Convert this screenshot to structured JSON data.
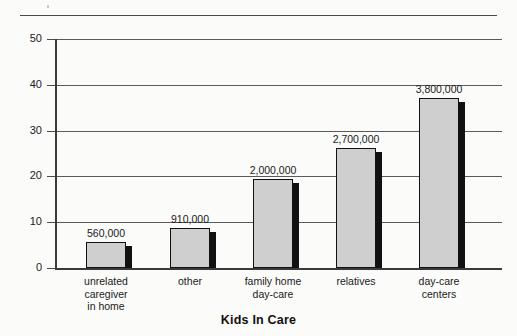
{
  "chart_data": {
    "type": "bar",
    "title": "Kids In Care",
    "xlabel": "",
    "ylabel": "",
    "ylim": [
      0,
      50
    ],
    "yticks": [
      0,
      10,
      20,
      30,
      40,
      50
    ],
    "ytick_labels": [
      "0",
      "10",
      "20",
      "30",
      "40",
      "50"
    ],
    "grid": true,
    "legend": "none",
    "categories": [
      "unrelated caregiver in home",
      "other",
      "family home day-care",
      "relatives",
      "day-care centers"
    ],
    "category_lines": [
      [
        "unrelated",
        "caregiver",
        "in home"
      ],
      [
        "other"
      ],
      [
        "family home",
        "day-care"
      ],
      [
        "relatives"
      ],
      [
        "day-care",
        "centers"
      ]
    ],
    "values": [
      5.6,
      9.1,
      20.0,
      27.0,
      38.0
    ],
    "bar_heights_units": [
      5.6,
      8.7,
      19.5,
      26.2,
      37.2
    ],
    "data_labels": [
      "560,000",
      "910,000",
      "2,000,000",
      "2,700,000",
      "3,800,000"
    ],
    "units_note": "bar height axis in hundred-thousands of children"
  },
  "style": {
    "bar_fill": "#cfcfcf",
    "bar_outline": "#111111",
    "bar_shadow": "#111111",
    "axis_color": "#3a3a3a",
    "grid_color": "#5a5a5a",
    "background": "#fbfbf9",
    "text_color": "#1a1a1a"
  }
}
